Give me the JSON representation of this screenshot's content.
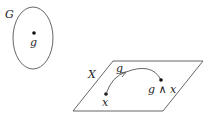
{
  "diagram": {
    "group": {
      "label": "G",
      "element_label": "g"
    },
    "space": {
      "label": "X"
    },
    "point_x": {
      "label": "x"
    },
    "action_arrow": {
      "label": "g"
    },
    "image_point": {
      "label": "g ∧ x"
    }
  }
}
